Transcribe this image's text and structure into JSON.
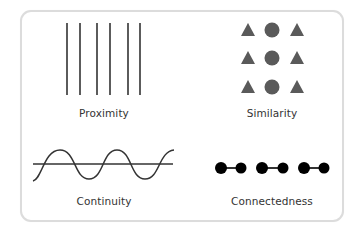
{
  "diagram": {
    "panels": [
      {
        "id": "proximity",
        "label": "Proximity",
        "description": "Six vertical lines grouped in three close pairs",
        "lines_x": [
          67,
          80,
          97,
          110,
          128,
          140
        ],
        "line_top": 23,
        "line_bottom": 95
      },
      {
        "id": "similarity",
        "label": "Similarity",
        "description": "3x3 grid: triangle, circle, triangle per row",
        "rows_y": [
          30,
          58,
          87
        ],
        "columns": [
          {
            "shape": "triangle",
            "x": 248
          },
          {
            "shape": "circle",
            "x": 272
          },
          {
            "shape": "triangle",
            "x": 297
          }
        ]
      },
      {
        "id": "continuity",
        "label": "Continuity",
        "description": "Sine wave crossing a straight horizontal line"
      },
      {
        "id": "connectedness",
        "label": "Connectedness",
        "description": "Three pairs of black dots, each pair joined by a line",
        "dots_x": [
          221,
          241,
          262,
          283,
          304,
          324
        ],
        "dots_y": 168
      }
    ],
    "colors": {
      "line": "#333333",
      "shape_fill": "#5a5a5a",
      "dot_fill": "#000000",
      "border": "#dcdcdc",
      "label_text": "#333333"
    }
  }
}
